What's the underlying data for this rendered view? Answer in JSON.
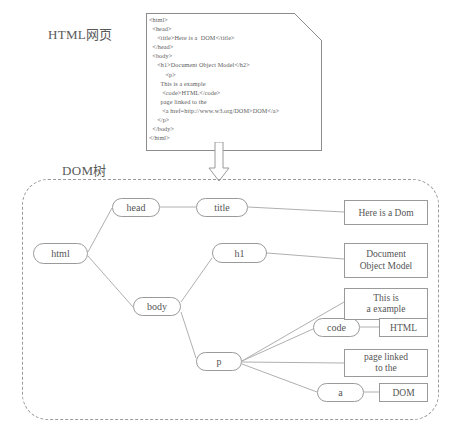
{
  "labels": {
    "html_page": "HTML网页",
    "dom_tree": "DOM树"
  },
  "code": {
    "lines": [
      "<html>",
      "  <head>",
      "     <title>Here is a  DOM</title>",
      "  </head>",
      "  <body>",
      "     <h1>Document Object Model</h2>",
      "          <p>",
      "       This is a example",
      "        <code>HTML</code>",
      "       page linked to the",
      "        <a href=http://www.w3.org/DOM>DOM</a>",
      "     </p>",
      "  </body>",
      "</html>"
    ]
  },
  "tree": {
    "nodes": {
      "html": "html",
      "head": "head",
      "body": "body",
      "title": "title",
      "h1": "h1",
      "p": "p",
      "code": "code",
      "a": "a"
    },
    "text_boxes": {
      "title_text": "Here is a Dom",
      "h1_text": "Document\nObject Model",
      "p_text1": "This is\na example",
      "code_text": "HTML",
      "p_text2": "page linked\nto the",
      "a_text": "DOM"
    }
  },
  "colors": {
    "stroke": "#9a9a9a",
    "doc_stroke": "#8c8c8c",
    "text": "#555555",
    "background": "#ffffff"
  }
}
